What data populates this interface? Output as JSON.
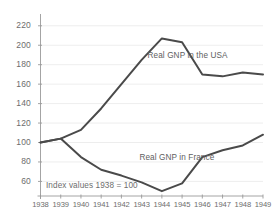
{
  "chart_data": {
    "type": "line",
    "title": "",
    "subtitle": "",
    "xlabel": "",
    "ylabel": "",
    "annotation": "Index values 1938 = 100",
    "grid": true,
    "legend_position": "inline-labels",
    "x": [
      1938,
      1939,
      1940,
      1941,
      1942,
      1943,
      1944,
      1945,
      1946,
      1947,
      1948,
      1949
    ],
    "xtick_labels": [
      "1938",
      "1939",
      "1940",
      "1941",
      "1942",
      "1943",
      "1944",
      "1945",
      "1946",
      "1947",
      "1948",
      "1949"
    ],
    "xlim": [
      1938,
      1949
    ],
    "ylim": [
      45,
      228
    ],
    "ytick_values": [
      60,
      80,
      100,
      120,
      140,
      160,
      180,
      200,
      220
    ],
    "ytick_labels": [
      "60",
      "80",
      "100",
      "120",
      "140",
      "160",
      "180",
      "200",
      "220"
    ],
    "series": [
      {
        "name": "Real GNP in the USA",
        "color": "#4a4a4a",
        "values": [
          100,
          104,
          113,
          135,
          160,
          185,
          207,
          203,
          170,
          168,
          172,
          170
        ],
        "label_x": 1947.0,
        "label_y": 188
      },
      {
        "name": "Real GNP in France",
        "color": "#4a4a4a",
        "values": [
          100,
          104,
          85,
          72,
          66,
          59,
          50,
          58,
          85,
          92,
          97,
          108
        ],
        "label_x": 1946.6,
        "label_y": 83
      }
    ]
  },
  "axis": {
    "y_axis_name": "y-axis",
    "x_axis_name": "x-axis"
  }
}
